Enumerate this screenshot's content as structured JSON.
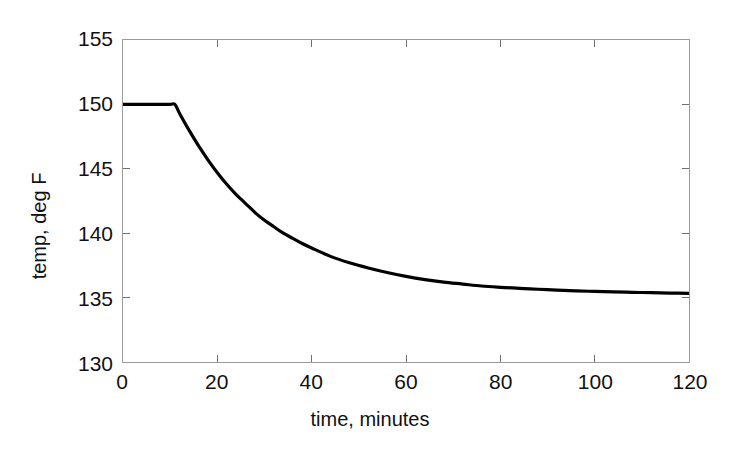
{
  "figure": {
    "background_color": "#ffffff",
    "axis_color": "#9a9a9a",
    "line_color": "#000000",
    "text_color": "#111111"
  },
  "chart_data": {
    "type": "line",
    "title": "",
    "subtitle": "",
    "xlabel": "time, minutes",
    "ylabel": "temp, deg F",
    "xlim": [
      0,
      120
    ],
    "ylim": [
      130,
      155
    ],
    "xticks": [
      0,
      20,
      40,
      60,
      80,
      100,
      120
    ],
    "yticks": [
      130,
      135,
      140,
      145,
      150,
      155
    ],
    "xtick_labels": [
      "0",
      "20",
      "40",
      "60",
      "80",
      "100",
      "120"
    ],
    "ytick_labels": [
      "130",
      "135",
      "140",
      "145",
      "150",
      "155"
    ],
    "grid": false,
    "legend": null,
    "legend_position": "none",
    "annotations": [],
    "series": [
      {
        "name": "temperature",
        "color": "#000000",
        "line_width": 3,
        "x": [
          0,
          2,
          4,
          6,
          8,
          10,
          11,
          12,
          14,
          16,
          18,
          20,
          22,
          24,
          26,
          28,
          30,
          32,
          34,
          36,
          38,
          40,
          44,
          48,
          52,
          56,
          60,
          64,
          68,
          72,
          76,
          80,
          84,
          88,
          92,
          96,
          100,
          104,
          108,
          112,
          116,
          120
        ],
        "y": [
          150.0,
          150.0,
          150.0,
          150.0,
          150.0,
          150.0,
          150.0,
          149.3,
          148.0,
          146.8,
          145.7,
          144.7,
          143.8,
          143.0,
          142.3,
          141.6,
          141.0,
          140.5,
          140.0,
          139.6,
          139.2,
          138.85,
          138.2,
          137.7,
          137.3,
          136.95,
          136.65,
          136.4,
          136.2,
          136.05,
          135.9,
          135.8,
          135.72,
          135.65,
          135.58,
          135.52,
          135.48,
          135.44,
          135.41,
          135.38,
          135.35,
          135.33
        ]
      }
    ]
  }
}
